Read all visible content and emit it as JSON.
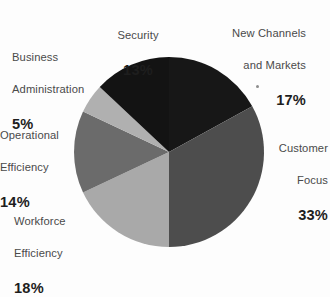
{
  "chart_data": {
    "type": "pie",
    "title": "",
    "subtitle": "",
    "xlabel": "",
    "ylabel": "",
    "legend_position": "none",
    "grid": false,
    "labels_inline": true,
    "start_angle_deg": 0,
    "direction": "clockwise",
    "categories": [
      "New Channels and Markets",
      "Customer Focus",
      "Workforce Efficiency",
      "Operational Efficiency",
      "Business Administration",
      "Security"
    ],
    "values": [
      17,
      33,
      18,
      14,
      5,
      13
    ],
    "value_suffix": "%",
    "total": 100,
    "colors": [
      "#171717",
      "#4d4d4d",
      "#a9a9a9",
      "#6b6b6b",
      "#b0b0b0",
      "#131313"
    ],
    "slices": [
      {
        "id": "new-channels-and-markets",
        "label_line1": "New Channels",
        "label_line2": "and Markets",
        "label_full": "New Channels and Markets",
        "value": 17,
        "percent_text": "17%",
        "color": "#171717",
        "start_deg": 0,
        "end_deg": 61.2
      },
      {
        "id": "customer-focus",
        "label_line1": "Customer",
        "label_line2": "Focus",
        "label_full": "Customer Focus",
        "value": 33,
        "percent_text": "33%",
        "color": "#4d4d4d",
        "start_deg": 61.2,
        "end_deg": 180.0
      },
      {
        "id": "workforce-efficiency",
        "label_line1": "Workforce",
        "label_line2": "Efficiency",
        "label_full": "Workforce Efficiency",
        "value": 18,
        "percent_text": "18%",
        "color": "#a9a9a9",
        "start_deg": 180.0,
        "end_deg": 244.8
      },
      {
        "id": "operational-efficiency",
        "label_line1": "Operational",
        "label_line2": "Efficiency",
        "label_full": "Operational Efficiency",
        "value": 14,
        "percent_text": "14%",
        "color": "#6b6b6b",
        "start_deg": 244.8,
        "end_deg": 295.2
      },
      {
        "id": "business-administration",
        "label_line1": "Business",
        "label_line2": "Administration",
        "label_full": "Business Administration",
        "value": 5,
        "percent_text": "5%",
        "color": "#b0b0b0",
        "start_deg": 295.2,
        "end_deg": 313.2
      },
      {
        "id": "security",
        "label_line1": "Security",
        "label_line2": "",
        "label_full": "Security",
        "value": 13,
        "percent_text": "13%",
        "color": "#131313",
        "start_deg": 313.2,
        "end_deg": 360.0
      }
    ],
    "geometry": {
      "center_x": 169,
      "center_y": 152,
      "radius": 95
    },
    "background_color": "#fdfdfd",
    "label_text_color": "#4a4a4a",
    "percent_text_color": "#1e1e1e"
  }
}
